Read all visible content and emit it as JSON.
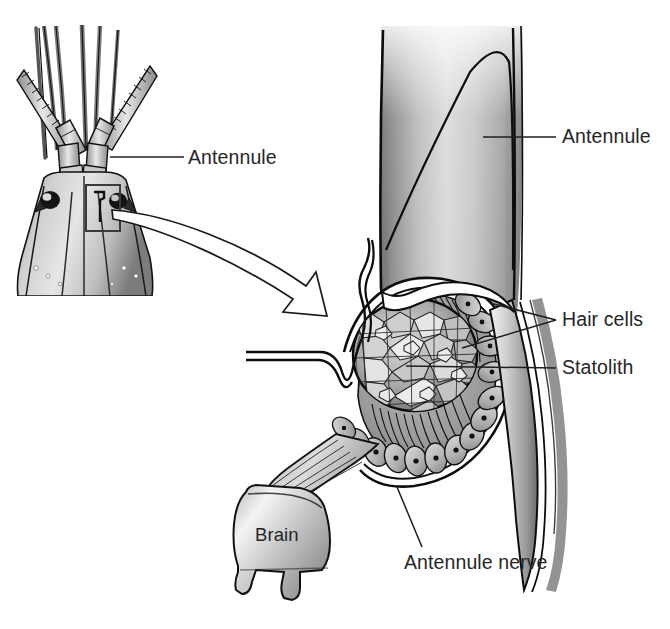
{
  "figure": {
    "domain": "anatomical-illustration",
    "background_color": "#ffffff",
    "ink_color": "#000000",
    "label_color": "#262626",
    "label_font_size_px": 19.5
  },
  "labels": {
    "antennule_left": "Antennule",
    "antennule_right": "Antennule",
    "hair_cells": "Hair cells",
    "statolith": "Statolith",
    "brain": "Brain",
    "antennule_nerve": "Antennule nerve"
  },
  "panels": {
    "left": {
      "name": "crayfish-head-dorsal-view",
      "description": "Dorsal view of crayfish head with paired antennae and antennules, eyes, and rostrum",
      "appendage_count": 6,
      "callout_box": {
        "x": 86,
        "y": 185,
        "width": 34,
        "height": 46
      },
      "crop_edge": {
        "left": 8,
        "top": 22,
        "right": 160,
        "bottom": 296
      }
    },
    "right": {
      "name": "statocyst-cutaway",
      "description": "Cutaway of antennule base showing statocyst sac with statolith, hair cell epithelium, antennule nerve, and brain"
    }
  },
  "leaders": [
    {
      "name": "leader-antennule-left",
      "from": [
        110,
        157
      ],
      "to": [
        184,
        157
      ]
    },
    {
      "name": "leader-antennule-right",
      "from": [
        483,
        137
      ],
      "to": [
        556,
        137
      ]
    },
    {
      "name": "leader-hair-cells-upper",
      "from": [
        490,
        303
      ],
      "to": [
        556,
        320
      ]
    },
    {
      "name": "leader-hair-cells-lower",
      "from": [
        462,
        347
      ],
      "to": [
        556,
        320
      ]
    },
    {
      "name": "leader-statolith",
      "from": [
        406,
        365
      ],
      "to": [
        556,
        368
      ]
    },
    {
      "name": "leader-antennule-nerve",
      "from": [
        397,
        487
      ],
      "to": [
        420,
        546
      ]
    }
  ],
  "arrow": {
    "name": "magnification-arrow",
    "style": "outlined-curved-block-arrow",
    "from": [
      112,
      212
    ],
    "to": [
      324,
      312
    ],
    "fill": "#ffffff",
    "stroke": "#000000"
  },
  "structures": [
    {
      "name": "antennule-cuticle",
      "shading": "grayscale-gradient"
    },
    {
      "name": "statolith",
      "shape": "oval",
      "texture": "granular-pebbled",
      "center": [
        415,
        355
      ],
      "rx": 62,
      "ry": 56
    },
    {
      "name": "hair-cell-epithelium",
      "cell_count_visible": 22,
      "nucleus": "dark-dot"
    },
    {
      "name": "statocyst-duct",
      "style": "double-line-channel"
    },
    {
      "name": "antennule-nerve",
      "style": "fiber-bundle",
      "fiber_count": 6
    },
    {
      "name": "brain",
      "shape": "rounded-block-with-two-roots"
    }
  ]
}
